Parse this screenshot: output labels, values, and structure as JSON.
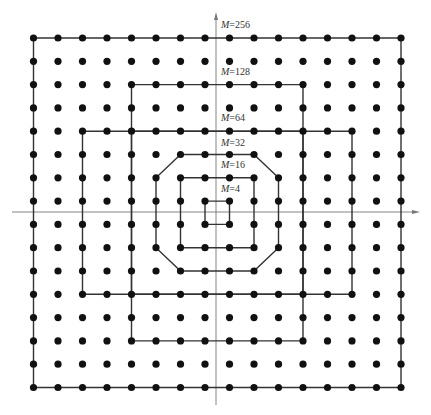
{
  "diagram": {
    "grid": {
      "columns": 16,
      "rows": 16,
      "col_x": [
        33.5,
        58,
        82.5,
        107,
        131.5,
        156,
        180.5,
        205,
        229.5,
        254,
        278.5,
        303,
        327.5,
        352,
        376.5,
        401
      ],
      "row_y": [
        38,
        61.3,
        84.6,
        107.9,
        131.2,
        154.5,
        177.8,
        201.1,
        224.4,
        247.7,
        271,
        294.3,
        317.6,
        340.9,
        364.2,
        387.5
      ],
      "dot_radius": 3.6,
      "dot_color": "#111111"
    },
    "axes": {
      "x_axis": {
        "x1": 12,
        "x2": 420,
        "y": 212
      },
      "y_axis": {
        "x": 216,
        "y1": 12,
        "y2": 405
      },
      "color": "#777777"
    },
    "line_color": "#333333",
    "constellations": [
      {
        "label_prefix": "M",
        "label_value": "=4",
        "order": 4,
        "polyline": [
          [
            7,
            7
          ],
          [
            8,
            7
          ],
          [
            8,
            8
          ],
          [
            7,
            8
          ],
          [
            7,
            7
          ]
        ],
        "label_pos": [
          221,
          192
        ]
      },
      {
        "label_prefix": "M",
        "label_value": "=16",
        "order": 16,
        "polyline": [
          [
            6,
            6
          ],
          [
            9,
            6
          ],
          [
            9,
            9
          ],
          [
            6,
            9
          ],
          [
            6,
            6
          ]
        ],
        "label_pos": [
          221,
          168
        ]
      },
      {
        "label_prefix": "M",
        "label_value": "=32",
        "order": 32,
        "polyline": [
          [
            6,
            5
          ],
          [
            9,
            5
          ],
          [
            10,
            6
          ],
          [
            10,
            9
          ],
          [
            9,
            10
          ],
          [
            6,
            10
          ],
          [
            5,
            9
          ],
          [
            5,
            6
          ],
          [
            6,
            5
          ]
        ],
        "label_pos": [
          221,
          146
        ]
      },
      {
        "label_prefix": "M",
        "label_value": "=64",
        "order": 64,
        "polyline": [
          [
            4,
            4
          ],
          [
            11,
            4
          ],
          [
            11,
            11
          ],
          [
            4,
            11
          ],
          [
            4,
            4
          ]
        ],
        "label_pos": [
          221,
          121
        ]
      },
      {
        "label_prefix": "M",
        "label_value": "=128",
        "order": 128,
        "polyline": [
          [
            4,
            2
          ],
          [
            11,
            2
          ],
          [
            11,
            4
          ],
          [
            13,
            4
          ],
          [
            13,
            11
          ],
          [
            11,
            11
          ],
          [
            11,
            13
          ],
          [
            4,
            13
          ],
          [
            4,
            11
          ],
          [
            2,
            11
          ],
          [
            2,
            4
          ],
          [
            4,
            4
          ],
          [
            4,
            2
          ]
        ],
        "label_pos": [
          221,
          75
        ]
      },
      {
        "label_prefix": "M",
        "label_value": "=256",
        "order": 256,
        "polyline": [
          [
            0,
            0
          ],
          [
            15,
            0
          ],
          [
            15,
            15
          ],
          [
            0,
            15
          ],
          [
            0,
            0
          ]
        ],
        "label_pos": [
          221,
          28
        ]
      }
    ],
    "extra_segments": [
      [
        [
          4,
          4
        ],
        [
          4,
          11
        ]
      ],
      [
        [
          11,
          4
        ],
        [
          11,
          11
        ]
      ],
      [
        [
          4,
          4
        ],
        [
          11,
          4
        ]
      ],
      [
        [
          4,
          11
        ],
        [
          11,
          11
        ]
      ]
    ]
  }
}
